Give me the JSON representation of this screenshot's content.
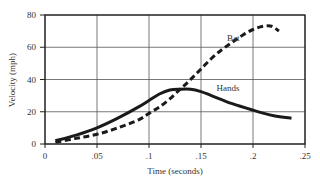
{
  "chart_data": {
    "type": "line",
    "title": "",
    "xlabel": "Time (seconds)",
    "ylabel": "Velocity (mph)",
    "xlim": [
      0,
      0.25
    ],
    "ylim": [
      0,
      80
    ],
    "x_ticks": [
      0,
      0.05,
      0.1,
      0.15,
      0.2,
      0.25
    ],
    "x_tick_labels": [
      "0",
      ".05",
      ".1",
      ".15",
      ".2",
      ".25"
    ],
    "y_ticks": [
      0,
      20,
      40,
      60,
      80
    ],
    "y_tick_labels": [
      "0",
      "20",
      "40",
      "60",
      "80"
    ],
    "grid": true,
    "legend": "inline labels",
    "series": [
      {
        "name": "Hands",
        "style": "solid",
        "label_pos": [
          0.165,
          33
        ],
        "x": [
          0.01,
          0.03,
          0.05,
          0.07,
          0.09,
          0.1,
          0.11,
          0.12,
          0.13,
          0.14,
          0.15,
          0.16,
          0.18,
          0.2,
          0.22,
          0.237
        ],
        "values": [
          2,
          5.5,
          10,
          16,
          23,
          27,
          31,
          33.5,
          34,
          34,
          32.5,
          30,
          25,
          21,
          17.5,
          16
        ]
      },
      {
        "name": "Bat",
        "style": "dashed",
        "label_pos": [
          0.175,
          64
        ],
        "x": [
          0.01,
          0.03,
          0.05,
          0.07,
          0.09,
          0.1,
          0.11,
          0.12,
          0.13,
          0.14,
          0.15,
          0.16,
          0.17,
          0.18,
          0.19,
          0.2,
          0.21,
          0.218,
          0.225
        ],
        "values": [
          1,
          3.5,
          6,
          10,
          15,
          19,
          23,
          28,
          34,
          40,
          46.5,
          53,
          58.5,
          63,
          67.5,
          71,
          73,
          73,
          70
        ]
      }
    ]
  }
}
